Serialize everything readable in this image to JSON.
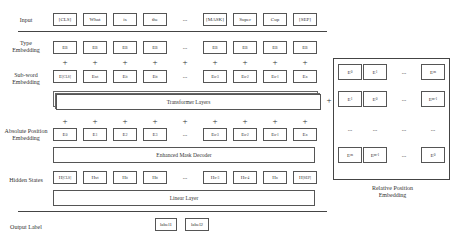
{
  "row_labels": {
    "input": "Input",
    "type_embedding": [
      "Type",
      "Embedding"
    ],
    "subword_embedding": [
      "Sub-word",
      "Embedding"
    ],
    "absolute_position": [
      "Absolute Position",
      "Embedding"
    ],
    "hidden_states": "Hidden States",
    "output_label": "Output Label"
  },
  "input_tokens": [
    "[CLS]",
    "What",
    "is",
    "the",
    "...",
    "[MASK]",
    "Super",
    "Cup",
    "[SEP]"
  ],
  "type_embeddings": [
    {
      "base": "E",
      "sub": "B"
    },
    {
      "base": "E",
      "sub": "B"
    },
    {
      "base": "E",
      "sub": "B"
    },
    {
      "base": "E",
      "sub": "B"
    },
    {
      "base": "...",
      "sub": ""
    },
    {
      "base": "E",
      "sub": "B"
    },
    {
      "base": "E",
      "sub": "B"
    },
    {
      "base": "E",
      "sub": "B"
    },
    {
      "base": "E",
      "sub": "B"
    }
  ],
  "subword_embeddings": [
    {
      "base": "E",
      "sub": "[CLS]"
    },
    {
      "base": "E",
      "sub": "wt"
    },
    {
      "base": "E",
      "sub": "it"
    },
    {
      "base": "E",
      "sub": "tt"
    },
    {
      "base": "...",
      "sub": ""
    },
    {
      "base": "E",
      "sub": "n-3"
    },
    {
      "base": "E",
      "sub": "n-2"
    },
    {
      "base": "E",
      "sub": "n-1"
    },
    {
      "base": "E",
      "sub": "n"
    }
  ],
  "absolute_position_embeddings": [
    {
      "base": "E",
      "sub": "0"
    },
    {
      "base": "E",
      "sub": "1"
    },
    {
      "base": "E",
      "sub": "2"
    },
    {
      "base": "E",
      "sub": "3"
    },
    {
      "base": "...",
      "sub": ""
    },
    {
      "base": "E",
      "sub": "n-3"
    },
    {
      "base": "E",
      "sub": "n-2"
    },
    {
      "base": "E",
      "sub": "n-1"
    },
    {
      "base": "E",
      "sub": "n"
    }
  ],
  "hidden_states": [
    {
      "base": "H",
      "sub": "[CLS]"
    },
    {
      "base": "H",
      "sub": "wt"
    },
    {
      "base": "H",
      "sub": "it"
    },
    {
      "base": "H",
      "sub": "tt"
    },
    {
      "base": "...",
      "sub": ""
    },
    {
      "base": "H",
      "sub": "n-3"
    },
    {
      "base": "H",
      "sub": "n-4"
    },
    {
      "base": "H",
      "sub": "n"
    },
    {
      "base": "H",
      "sub": "[SEP]"
    }
  ],
  "plus": "+",
  "layers": {
    "transformer": "Transformer Layers",
    "decoder": "Enhanced Mask Decoder",
    "linear": "Linear Layer"
  },
  "output_labels": [
    "label1",
    "label2"
  ],
  "relative_position": {
    "title": [
      "Relative Position",
      "Embedding"
    ],
    "matrix": [
      [
        {
          "base": "E",
          "sub": "0"
        },
        {
          "base": "E",
          "sub": "1"
        },
        {
          "base": "...",
          "sub": ""
        },
        {
          "base": "E",
          "sub": "m"
        }
      ],
      [
        {
          "base": "E",
          "sub": "1"
        },
        {
          "base": "E",
          "sub": "0"
        },
        {
          "base": "...",
          "sub": ""
        },
        {
          "base": "E",
          "sub": "m-1"
        }
      ],
      [
        {
          "base": "...",
          "sub": ""
        },
        {
          "base": "...",
          "sub": ""
        },
        {
          "base": "...",
          "sub": ""
        },
        {
          "base": "...",
          "sub": ""
        }
      ],
      [
        {
          "base": "E",
          "sub": "m"
        },
        {
          "base": "E",
          "sub": "m-1"
        },
        {
          "base": "...",
          "sub": ""
        },
        {
          "base": "E",
          "sub": "0"
        }
      ]
    ]
  }
}
